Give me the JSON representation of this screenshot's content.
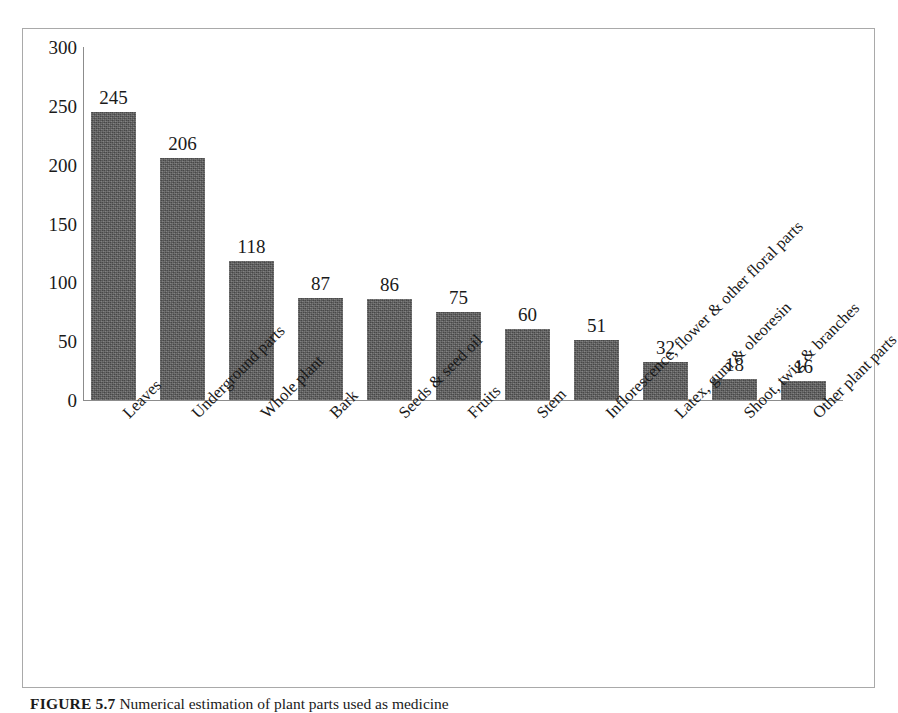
{
  "caption": {
    "label": "FIGURE 5.7",
    "text": "Numerical estimation of plant parts used as medicine"
  },
  "chart_data": {
    "type": "bar",
    "title": "",
    "xlabel": "",
    "ylabel": "",
    "ylim": [
      0,
      300
    ],
    "grid": false,
    "legend": "none",
    "y_ticks": [
      "0",
      "50",
      "100",
      "150",
      "200",
      "250",
      "300"
    ],
    "y_tick_values": [
      0,
      50,
      100,
      150,
      200,
      250,
      300
    ],
    "categories": [
      "Leaves",
      "Underground parts",
      "Whole plant",
      "Bark",
      "Seeds & seed oil",
      "Fruits",
      "Stem",
      "Inflorescence, flower & other floral parts",
      "Latex, gum & oleoresin",
      "Shoot, twig & branches",
      "Other plant parts"
    ],
    "values": [
      245,
      206,
      118,
      87,
      86,
      75,
      60,
      51,
      32,
      18,
      16
    ],
    "data_labels": [
      "245",
      "206",
      "118",
      "87",
      "86",
      "75",
      "60",
      "51",
      "32",
      "18",
      "16"
    ],
    "bar_color": "#5e5e5e"
  }
}
